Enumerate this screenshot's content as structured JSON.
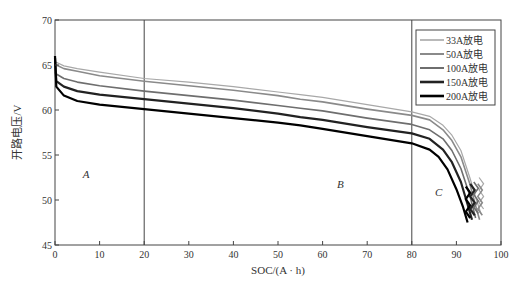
{
  "chart_data": {
    "type": "line",
    "title": "",
    "xlabel": "SOC/(A · h)",
    "ylabel": "开路电压/V",
    "xlim": [
      0,
      100
    ],
    "ylim": [
      45,
      70
    ],
    "xticks": [
      0,
      10,
      20,
      30,
      40,
      50,
      60,
      70,
      80,
      90,
      100
    ],
    "yticks": [
      45,
      50,
      55,
      60,
      65,
      70
    ],
    "grid": false,
    "legend_position": "upper right",
    "vlines": [
      20,
      80
    ],
    "annotations": [
      {
        "text": "A",
        "x": 7,
        "y": 52.4
      },
      {
        "text": "B",
        "x": 64,
        "y": 51.3
      },
      {
        "text": "C",
        "x": 86,
        "y": 50.4
      }
    ],
    "series": [
      {
        "name": "33A放电",
        "color": "#a8a8a8",
        "width": 1.2,
        "x": [
          0,
          0.3,
          2,
          5,
          10,
          20,
          30,
          40,
          50,
          55,
          60,
          70,
          80,
          84,
          87,
          89,
          91,
          93,
          94.5,
          95.5
        ],
        "y": [
          65.3,
          65.3,
          64.9,
          64.6,
          64.2,
          63.5,
          63.1,
          62.6,
          62.0,
          61.7,
          61.4,
          60.6,
          59.8,
          59.3,
          58.3,
          57.2,
          55.5,
          52.5,
          50.0,
          48.5
        ]
      },
      {
        "name": "50A放电",
        "color": "#8a8a8a",
        "width": 1.6,
        "x": [
          0,
          0.3,
          2,
          5,
          10,
          20,
          30,
          40,
          50,
          55,
          60,
          70,
          80,
          84,
          87,
          89,
          91,
          93,
          94.5,
          95.2
        ],
        "y": [
          65.0,
          65.0,
          64.6,
          64.3,
          63.8,
          63.2,
          62.7,
          62.2,
          61.6,
          61.2,
          60.9,
          60.1,
          59.4,
          58.9,
          57.8,
          56.6,
          54.8,
          51.8,
          49.0,
          47.8
        ]
      },
      {
        "name": "100A放电",
        "color": "#6e6e6e",
        "width": 1.6,
        "x": [
          0,
          0.3,
          2,
          5,
          10,
          20,
          30,
          40,
          50,
          55,
          60,
          70,
          80,
          84,
          87,
          89,
          91,
          93,
          94.3
        ],
        "y": [
          64.2,
          64.0,
          63.5,
          63.1,
          62.7,
          62.1,
          61.6,
          61.1,
          60.5,
          60.2,
          59.9,
          59.1,
          58.4,
          57.8,
          56.8,
          55.5,
          53.5,
          50.5,
          48.0
        ]
      },
      {
        "name": "150A放电",
        "color": "#222222",
        "width": 2.2,
        "x": [
          0,
          0.3,
          2,
          5,
          10,
          20,
          30,
          40,
          50,
          55,
          60,
          70,
          80,
          84,
          87,
          89,
          91,
          92.5,
          93.5
        ],
        "y": [
          65.8,
          63.2,
          62.6,
          62.1,
          61.7,
          61.2,
          60.7,
          60.2,
          59.6,
          59.2,
          58.9,
          58.1,
          57.4,
          56.8,
          55.6,
          54.2,
          52.0,
          49.5,
          47.8
        ]
      },
      {
        "name": "200A放电",
        "color": "#000000",
        "width": 2.2,
        "x": [
          0,
          0.3,
          2,
          5,
          10,
          20,
          30,
          40,
          50,
          55,
          60,
          70,
          80,
          84,
          86,
          88,
          90,
          91.5,
          92.5
        ],
        "y": [
          66.0,
          62.6,
          61.6,
          61.0,
          60.6,
          60.1,
          59.6,
          59.1,
          58.6,
          58.3,
          57.9,
          57.1,
          56.3,
          55.6,
          54.8,
          53.4,
          51.2,
          49.2,
          47.5
        ]
      }
    ]
  }
}
